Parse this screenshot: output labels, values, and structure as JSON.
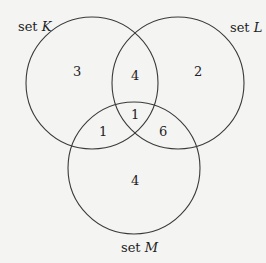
{
  "diagram": {
    "type": "venn",
    "sets": [
      {
        "id": "K",
        "prefix": "set ",
        "name": "K"
      },
      {
        "id": "L",
        "prefix": "set ",
        "name": "L"
      },
      {
        "id": "M",
        "prefix": "set ",
        "name": "M"
      }
    ],
    "regions": {
      "K_only": "3",
      "L_only": "2",
      "M_only": "4",
      "K_L_only": "4",
      "K_M_only": "1",
      "L_M_only": "6",
      "K_L_M": "1"
    },
    "stroke_color": "#3a3a3a",
    "background_color": "#f4f4f3"
  }
}
